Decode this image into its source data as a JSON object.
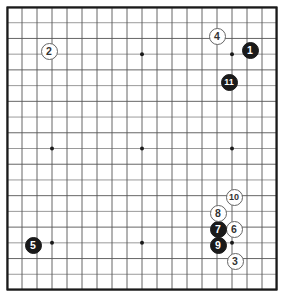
{
  "board": {
    "name": "go-board",
    "size": 19,
    "columns": 19,
    "rows": 19,
    "line_color": "#555555",
    "border_color": "#1a1a1a",
    "background_color": "#ffffff",
    "star_point_color": "#1a1a1a",
    "star_points": [
      {
        "col": 3,
        "row": 3
      },
      {
        "col": 9,
        "row": 3
      },
      {
        "col": 15,
        "row": 3
      },
      {
        "col": 3,
        "row": 9
      },
      {
        "col": 9,
        "row": 9
      },
      {
        "col": 15,
        "row": 9
      },
      {
        "col": 3,
        "row": 15
      },
      {
        "col": 9,
        "row": 15
      },
      {
        "col": 15,
        "row": 15
      }
    ],
    "geometry": {
      "left": 7,
      "top": 7,
      "right": 277,
      "bottom": 290,
      "cell_width": 15.0,
      "cell_height": 15.7,
      "stone_diameter": 17
    }
  },
  "stones": [
    {
      "label": "1",
      "color": "black",
      "col": 16,
      "row": 2,
      "x": 250,
      "y": 50
    },
    {
      "label": "2",
      "color": "white",
      "col": 3,
      "row": 2,
      "x": 49,
      "y": 51
    },
    {
      "label": "3",
      "color": "white",
      "col": 15,
      "row": 16,
      "x": 235,
      "y": 261
    },
    {
      "label": "4",
      "color": "white",
      "col": 14,
      "row": 1,
      "x": 217,
      "y": 36
    },
    {
      "label": "5",
      "color": "black",
      "col": 2,
      "row": 15,
      "x": 33,
      "y": 245
    },
    {
      "label": "6",
      "color": "white",
      "col": 16,
      "row": 14,
      "x": 234,
      "y": 229
    },
    {
      "label": "7",
      "color": "black",
      "col": 15,
      "row": 14,
      "x": 218,
      "y": 229
    },
    {
      "label": "8",
      "color": "white",
      "col": 15,
      "row": 13,
      "x": 218,
      "y": 213
    },
    {
      "label": "9",
      "color": "black",
      "col": 15,
      "row": 15,
      "x": 218,
      "y": 245
    },
    {
      "label": "10",
      "color": "white",
      "col": 16,
      "row": 12,
      "x": 234,
      "y": 197
    },
    {
      "label": "11",
      "color": "black",
      "col": 16,
      "row": 4,
      "x": 229,
      "y": 82
    }
  ],
  "meta": {
    "move_count": 11,
    "black_stone_label_color": "#ffffff",
    "white_stone_label_color": "#333333"
  }
}
